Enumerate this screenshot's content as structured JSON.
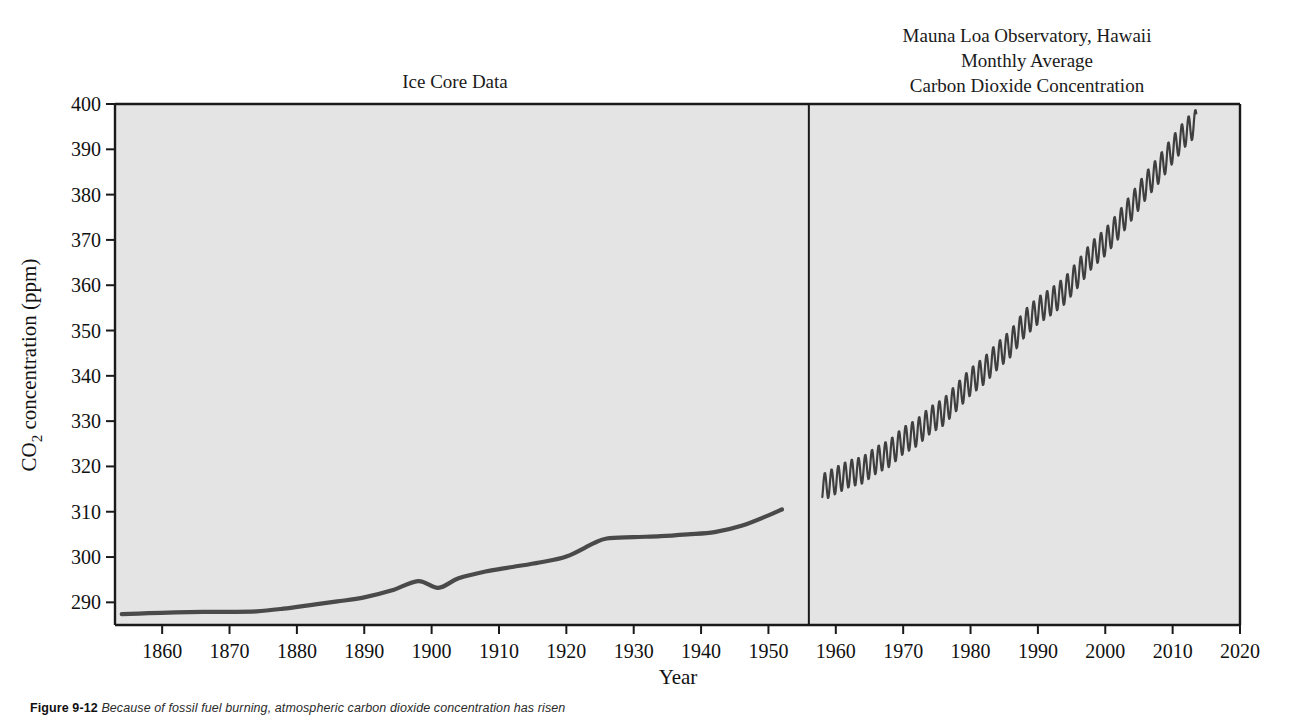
{
  "figure": {
    "caption_label": "Figure 9-12",
    "caption_text": "Because of fossil fuel burning, atmospheric carbon dioxide concentration has risen"
  },
  "panels": {
    "left_title": "Ice Core Data",
    "right_title_line1": "Mauna Loa Observatory, Hawaii",
    "right_title_line2": "Monthly Average",
    "right_title_line3": "Carbon Dioxide Concentration"
  },
  "axes": {
    "x_label": "Year",
    "y_label_prefix": "CO",
    "y_label_sub": "2",
    "y_label_suffix": " concentration (ppm)",
    "x_ticks": [
      "1860",
      "1870",
      "1880",
      "1890",
      "1900",
      "1910",
      "1920",
      "1930",
      "1940",
      "1950",
      "1960",
      "1970",
      "1980",
      "1990",
      "2000",
      "2010",
      "2020"
    ],
    "y_ticks": [
      "290",
      "300",
      "310",
      "320",
      "330",
      "340",
      "350",
      "360",
      "370",
      "380",
      "390",
      "400"
    ]
  },
  "style": {
    "plot_background": "#e4e4e4",
    "frame_color": "#1a1a1a",
    "series_color": "#4a4a4a"
  },
  "chart_data": {
    "type": "line",
    "title": "Atmospheric Carbon Dioxide Concentration",
    "xlabel": "Year",
    "ylabel": "CO2 concentration (ppm)",
    "xlim": [
      1853,
      2020
    ],
    "ylim": [
      285,
      400
    ],
    "grid": false,
    "legend": "none",
    "panel_divider_year": 1956,
    "series": [
      {
        "name": "Ice Core Data",
        "panel": "left",
        "x": [
          1854,
          1858,
          1862,
          1866,
          1870,
          1874,
          1878,
          1882,
          1886,
          1890,
          1894,
          1898,
          1901,
          1904,
          1908,
          1912,
          1916,
          1920,
          1924,
          1926,
          1930,
          1934,
          1938,
          1942,
          1946,
          1950,
          1952
        ],
        "values": [
          287.4,
          287.6,
          287.8,
          287.9,
          287.9,
          288.0,
          288.6,
          289.4,
          290.2,
          291.1,
          292.6,
          294.7,
          293.2,
          295.3,
          296.8,
          297.8,
          298.8,
          300.1,
          303.0,
          304.1,
          304.4,
          304.6,
          305.0,
          305.5,
          306.9,
          309.2,
          310.5
        ]
      },
      {
        "name": "Mauna Loa Monthly Average",
        "panel": "right",
        "seasonal_amplitude_ppm": 6,
        "x": [
          1958,
          1960,
          1962,
          1964,
          1966,
          1968,
          1970,
          1972,
          1974,
          1976,
          1978,
          1980,
          1982,
          1984,
          1986,
          1988,
          1990,
          1992,
          1994,
          1996,
          1998,
          2000,
          2002,
          2004,
          2006,
          2008,
          2010,
          2012,
          2013.5
        ],
        "values": [
          315.3,
          316.9,
          318.4,
          319.2,
          321.4,
          322.9,
          325.7,
          327.4,
          330.2,
          332.0,
          335.4,
          338.7,
          341.1,
          344.4,
          347.2,
          351.5,
          354.4,
          356.4,
          358.8,
          362.6,
          366.7,
          369.5,
          373.3,
          377.5,
          381.9,
          385.6,
          389.9,
          393.8,
          395.9
        ]
      }
    ]
  }
}
